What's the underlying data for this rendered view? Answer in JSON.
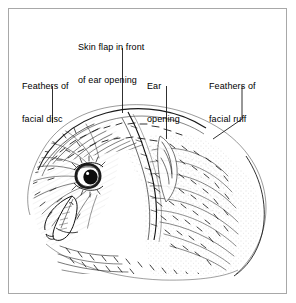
{
  "figure": {
    "style": "pen-and-ink line illustration",
    "frame_color": "#a8a8a8",
    "ink_color": "#1a1a1a",
    "background_color": "#ffffff"
  },
  "labels": [
    {
      "id": "skin-flap",
      "line1": "Skin flap in front",
      "line2": "of ear opening",
      "x": 78,
      "y": 20,
      "leader": {
        "type": "vertical",
        "x": 122,
        "y1": 48,
        "y2": 113
      }
    },
    {
      "id": "facial-disc",
      "line1": "Feathers of",
      "line2": "facial disc",
      "x": 22,
      "y": 59,
      "leader": {
        "type": "vertical",
        "x": 52,
        "y1": 86,
        "y2": 123
      }
    },
    {
      "id": "ear-opening",
      "line1": "Ear",
      "line2": "opening",
      "x": 147,
      "y": 59,
      "leader": {
        "type": "vertical",
        "x": 166,
        "y1": 86,
        "y2": 139
      }
    },
    {
      "id": "facial-ruff",
      "line1": "Feathers of",
      "line2": "facial ruff",
      "x": 209,
      "y": 59,
      "leader": {
        "type": "elbow",
        "x": 242,
        "y1": 86,
        "y2": 119,
        "x2": 213,
        "y3": 139
      }
    }
  ]
}
